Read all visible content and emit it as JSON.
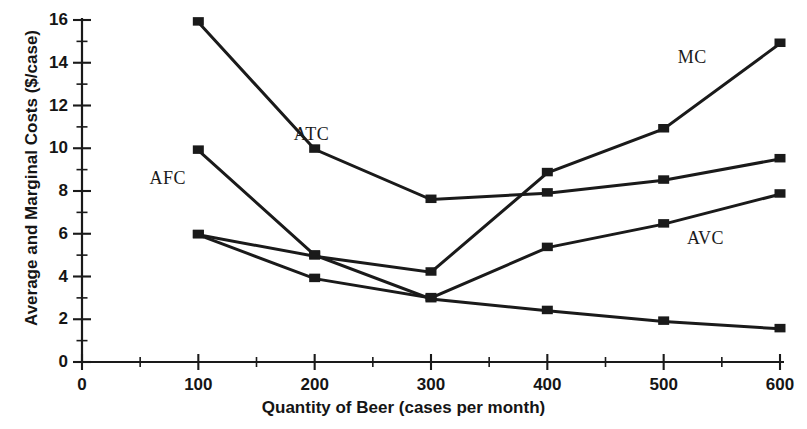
{
  "chart_data": {
    "type": "line",
    "title": "",
    "xlabel": "Quantity of Beer (cases per month)",
    "ylabel": "Average and Marginal Costs ($/case)",
    "x": [
      100,
      200,
      300,
      400,
      500,
      600
    ],
    "xlim": [
      0,
      600
    ],
    "ylim": [
      0,
      16
    ],
    "xticks": [
      0,
      100,
      200,
      300,
      400,
      500,
      600
    ],
    "yticks": [
      0,
      2,
      4,
      6,
      8,
      10,
      12,
      14,
      16
    ],
    "xminor_step": 50,
    "yminor_step": 1,
    "grid": false,
    "legend_position": "inline-annotations",
    "marker": "filled-square",
    "line_color": "#1a1a1a",
    "series": [
      {
        "name": "ATC",
        "label": "ATC",
        "values": [
          15.9,
          9.95,
          7.6,
          7.9,
          8.5,
          9.5
        ]
      },
      {
        "name": "MC",
        "label": "MC",
        "values": [
          5.95,
          4.95,
          4.2,
          8.85,
          10.9,
          14.9
        ]
      },
      {
        "name": "AVC",
        "label": "AVC",
        "values": [
          5.95,
          3.9,
          3.0,
          5.35,
          6.45,
          7.85
        ]
      },
      {
        "name": "AFC",
        "label": "AFC",
        "values": [
          9.9,
          5.0,
          2.95,
          2.4,
          1.9,
          1.55
        ]
      }
    ],
    "annotations": [
      {
        "text": "ATC",
        "x": 182,
        "y": 10.6
      },
      {
        "text": "AFC",
        "x": 58,
        "y": 8.55
      },
      {
        "text": "MC",
        "x": 512,
        "y": 14.2
      },
      {
        "text": "AVC",
        "x": 520,
        "y": 5.75
      }
    ]
  },
  "axes": {
    "y_tick_labels": [
      "16",
      "14",
      "12",
      "10",
      "8",
      "6",
      "4",
      "2",
      "0"
    ],
    "x_tick_labels": [
      "0",
      "100",
      "200",
      "300",
      "400",
      "500",
      "600"
    ],
    "y_title": "Average and Marginal Costs ($/case)",
    "x_title": "Quantity of Beer (cases per month)"
  }
}
